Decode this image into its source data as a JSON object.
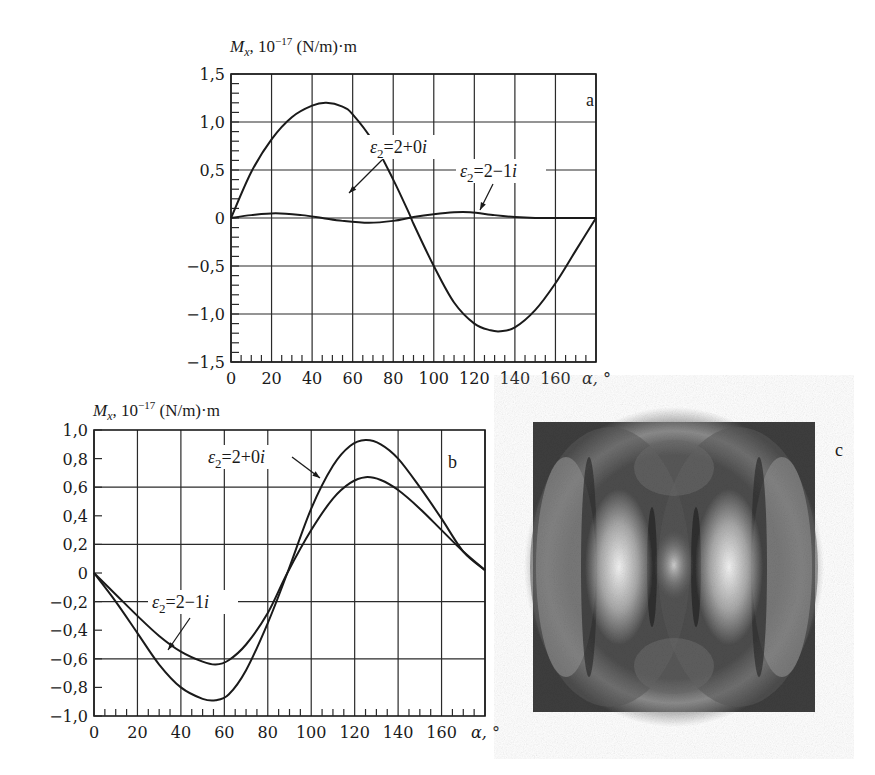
{
  "figure": {
    "panel_c": {
      "letter": "c",
      "description": "grayscale interference pattern image",
      "frame": {
        "x": 533,
        "y": 422,
        "w": 282,
        "h": 290
      }
    }
  },
  "chart_data": [
    {
      "panel": "a",
      "type": "line",
      "title": "",
      "ylabel": "M_x, 10^-17 (N/m)·m",
      "ylabel_parts": {
        "symbol": "M",
        "sub": "x",
        "rest": ", 10",
        "exp": "−17",
        "unit": " (N/m)·m"
      },
      "xlabel": "α, °",
      "xlim": [
        0,
        180
      ],
      "ylim": [
        -1.5,
        1.5
      ],
      "xticks": [
        0,
        20,
        40,
        60,
        80,
        100,
        120,
        140,
        160
      ],
      "xtick_labels": [
        "0",
        "20",
        "40",
        "60",
        "80",
        "100",
        "120",
        "140",
        "160"
      ],
      "yticks": [
        1.5,
        1.0,
        0.5,
        0,
        -0.5,
        -1.0,
        -1.5
      ],
      "ytick_labels": [
        "1,5",
        "1,0",
        "0,5",
        "0",
        "−0,5",
        "−1,0",
        "−1,5"
      ],
      "grid": true,
      "panel_letter": "a",
      "series": [
        {
          "name": "ε2=2+0i",
          "x": [
            0,
            10,
            20,
            30,
            40,
            47,
            55,
            60,
            70,
            80,
            88,
            90,
            100,
            110,
            120,
            128,
            133,
            140,
            150,
            160,
            170,
            180
          ],
          "values": [
            0,
            0.48,
            0.82,
            1.05,
            1.17,
            1.2,
            1.16,
            1.08,
            0.8,
            0.4,
            0.04,
            -0.06,
            -0.5,
            -0.88,
            -1.1,
            -1.17,
            -1.18,
            -1.14,
            -0.96,
            -0.68,
            -0.34,
            0
          ]
        },
        {
          "name": "ε2=2−1i",
          "x": [
            0,
            10,
            22,
            35,
            45,
            55,
            68,
            80,
            90,
            100,
            110,
            118,
            130,
            140,
            150,
            160,
            170,
            180
          ],
          "values": [
            0,
            0.03,
            0.05,
            0.03,
            0.0,
            -0.03,
            -0.05,
            -0.03,
            0.01,
            0.04,
            0.06,
            0.06,
            0.03,
            0.01,
            0.0,
            0.0,
            0.0,
            0
          ]
        }
      ],
      "annotations": [
        {
          "text_main": "ε",
          "sub": "2",
          "rest": "=2+0i",
          "series": "ε2=2+0i"
        },
        {
          "text_main": "ε",
          "sub": "2",
          "rest": "=2−1i",
          "series": "ε2=2−1i"
        }
      ]
    },
    {
      "panel": "b",
      "type": "line",
      "title": "",
      "ylabel": "M_x, 10^-17 (N/m)·m",
      "ylabel_parts": {
        "symbol": "M",
        "sub": "x",
        "rest": ", 10",
        "exp": "−17",
        "unit": " (N/m)·m"
      },
      "xlabel": "α, °",
      "xlim": [
        0,
        180
      ],
      "ylim": [
        -1.0,
        1.0
      ],
      "xticks": [
        0,
        20,
        40,
        60,
        80,
        100,
        120,
        140,
        160
      ],
      "xtick_labels": [
        "0",
        "20",
        "40",
        "60",
        "80",
        "100",
        "120",
        "140",
        "160"
      ],
      "yticks": [
        1.0,
        0.8,
        0.6,
        0.4,
        0.2,
        0,
        -0.2,
        -0.4,
        -0.6,
        -0.8,
        -1.0
      ],
      "ytick_labels": [
        "1,0",
        "0,8",
        "0,6",
        "0,4",
        "0,2",
        "0",
        "−0,2",
        "−0,4",
        "−0,6",
        "−0,8",
        "−1,0"
      ],
      "grid": true,
      "panel_letter": "b",
      "series": [
        {
          "name": "ε2=2+0i",
          "x": [
            0,
            10,
            20,
            30,
            40,
            50,
            56,
            62,
            70,
            80,
            89,
            100,
            110,
            118,
            125,
            132,
            140,
            150,
            160,
            170,
            180
          ],
          "values": [
            0,
            -0.2,
            -0.42,
            -0.64,
            -0.8,
            -0.88,
            -0.89,
            -0.85,
            -0.68,
            -0.35,
            0.0,
            0.45,
            0.75,
            0.89,
            0.93,
            0.9,
            0.8,
            0.6,
            0.38,
            0.15,
            0.02
          ]
        },
        {
          "name": "ε2=2−1i",
          "x": [
            0,
            10,
            20,
            30,
            40,
            50,
            56,
            62,
            70,
            80,
            89,
            100,
            110,
            118,
            125,
            132,
            140,
            150,
            160,
            170,
            180
          ],
          "values": [
            0,
            -0.15,
            -0.3,
            -0.44,
            -0.55,
            -0.62,
            -0.64,
            -0.61,
            -0.5,
            -0.28,
            0.0,
            0.3,
            0.52,
            0.63,
            0.67,
            0.65,
            0.58,
            0.45,
            0.3,
            0.15,
            0.02
          ]
        }
      ],
      "annotations": [
        {
          "text_main": "ε",
          "sub": "2",
          "rest": "=2+0i",
          "series": "ε2=2+0i"
        },
        {
          "text_main": "ε",
          "sub": "2",
          "rest": "=2−1i",
          "series": "ε2=2−1i"
        }
      ]
    }
  ]
}
